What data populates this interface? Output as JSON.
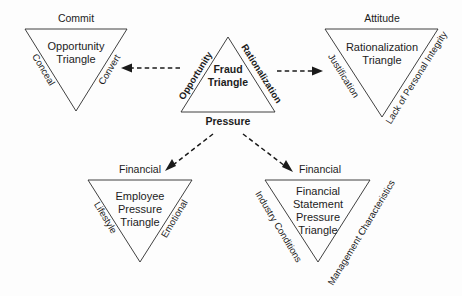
{
  "diagram": {
    "background_color": "#fdfdfd",
    "line_color": "#2b2b2b",
    "text_color": "#1c1c1c",
    "center": {
      "inner_line1": "Fraud",
      "inner_line2": "Triangle",
      "side_left": "Opportunity",
      "side_right": "Rationalization",
      "side_bottom": "Pressure",
      "orientation": "point-up"
    },
    "opportunity_triangle": {
      "top_label": "Commit",
      "inner_line1": "Opportunity",
      "inner_line2": "Triangle",
      "side_left": "Conceal",
      "side_right": "Convert",
      "orientation": "point-down"
    },
    "rationalization_triangle": {
      "top_label": "Attitude",
      "inner_line1": "Rationalization",
      "inner_line2": "Triangle",
      "side_left": "Justification",
      "side_right": "Lack of Personal Integrity",
      "orientation": "point-down"
    },
    "employee_pressure_triangle": {
      "top_label": "Financial",
      "inner_line1": "Employee",
      "inner_line2": "Pressure",
      "inner_line3": "Triangle",
      "side_left": "Lifestyle",
      "side_right": "Emotional",
      "orientation": "point-down"
    },
    "financial_statement_pressure_triangle": {
      "top_label": "Financial",
      "inner_line1": "Financial",
      "inner_line2": "Statement",
      "inner_line3": "Pressure",
      "inner_line4": "Triangle",
      "side_left": "Industry Conditions",
      "side_right": "Management Characteristics",
      "orientation": "point-down"
    },
    "connectors": [
      {
        "name": "opportunity-arrow",
        "from": "center",
        "to": "opportunity_triangle",
        "style": "dashed",
        "direction": "left"
      },
      {
        "name": "rationalization-arrow",
        "from": "center",
        "to": "rationalization_triangle",
        "style": "dashed",
        "direction": "right"
      },
      {
        "name": "pressure-employee-arrow",
        "from": "center",
        "to": "employee_pressure_triangle",
        "style": "dashed",
        "direction": "down-left"
      },
      {
        "name": "pressure-financial-arrow",
        "from": "center",
        "to": "financial_statement_pressure_triangle",
        "style": "dashed",
        "direction": "down-right"
      }
    ]
  }
}
